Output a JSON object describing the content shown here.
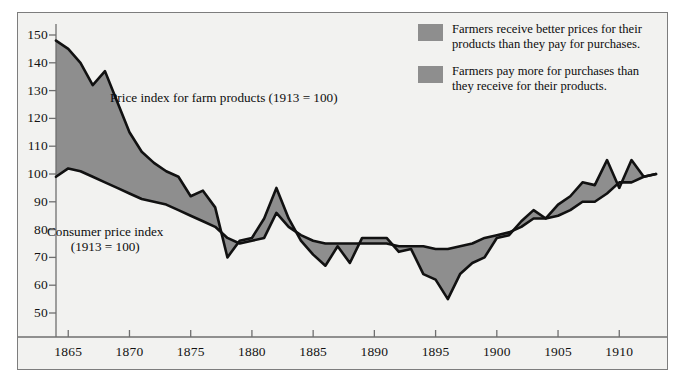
{
  "figure": {
    "background_color": "#ffffff",
    "panel_color": "#f2f2f0",
    "frame_color": "#7d7d7d",
    "line_color": "#111111",
    "fill_color": "#8e8e8e"
  },
  "legend": {
    "position": "top-right",
    "items": [
      {
        "swatch_color": "#8e8e8e",
        "text": "Farmers receive better prices for their products than they pay for purchases."
      },
      {
        "swatch_color": "#8e8e8e",
        "text": "Farmers pay more for purchases than they receive for their products."
      }
    ]
  },
  "annotations": {
    "farm_label": "Price index for farm products (1913 = 100)",
    "consumer_label_line1": "Consumer price index",
    "consumer_label_line2": "(1913 = 100)"
  },
  "chart_data": {
    "type": "area",
    "title": "",
    "subtitle": "",
    "xlabel": "",
    "ylabel": "",
    "xlim": [
      1864,
      1913
    ],
    "ylim": [
      45,
      152
    ],
    "grid": false,
    "legend_position": "top-right",
    "xticks": [
      1865,
      1870,
      1875,
      1880,
      1885,
      1890,
      1895,
      1900,
      1905,
      1910
    ],
    "yticks": [
      50,
      60,
      70,
      80,
      90,
      100,
      110,
      120,
      130,
      140,
      150
    ],
    "x": [
      1864,
      1865,
      1866,
      1867,
      1868,
      1869,
      1870,
      1871,
      1872,
      1873,
      1874,
      1875,
      1876,
      1877,
      1878,
      1879,
      1880,
      1881,
      1882,
      1883,
      1884,
      1885,
      1886,
      1887,
      1888,
      1889,
      1890,
      1891,
      1892,
      1893,
      1894,
      1895,
      1896,
      1897,
      1898,
      1899,
      1900,
      1901,
      1902,
      1903,
      1904,
      1905,
      1906,
      1907,
      1908,
      1909,
      1910,
      1911,
      1912,
      1913
    ],
    "series": [
      {
        "name": "Price index for farm products (1913 = 100)",
        "label_in_plot": "Price index for farm products (1913 = 100)",
        "values": [
          148,
          145,
          140,
          132,
          137,
          126,
          115,
          108,
          104,
          101,
          99,
          92,
          94,
          88,
          70,
          76,
          77,
          84,
          95,
          84,
          76,
          71,
          67,
          74,
          68,
          77,
          77,
          77,
          72,
          73,
          64,
          62,
          55,
          64,
          68,
          70,
          77,
          78,
          83,
          87,
          84,
          89,
          92,
          97,
          96,
          105,
          95,
          105,
          99,
          100
        ]
      },
      {
        "name": "Consumer price index (1913 = 100)",
        "label_in_plot": "Consumer price index (1913 = 100)",
        "values": [
          99,
          102,
          101,
          99,
          97,
          95,
          93,
          91,
          90,
          89,
          87,
          85,
          83,
          81,
          77,
          75,
          76,
          77,
          86,
          81,
          78,
          76,
          75,
          75,
          75,
          75,
          75,
          75,
          74,
          74,
          74,
          73,
          73,
          74,
          75,
          77,
          78,
          79,
          81,
          84,
          84,
          85,
          87,
          90,
          90,
          93,
          97,
          97,
          99,
          100
        ]
      }
    ]
  }
}
